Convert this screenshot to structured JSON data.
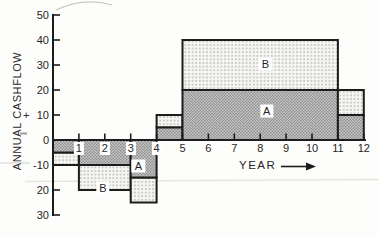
{
  "y_axis": {
    "title": "ANNUAL CASHFLOW",
    "plus": "+"
  },
  "x_axis": {
    "title": "YEAR"
  },
  "chart_data": {
    "type": "area",
    "xlabel": "YEAR",
    "ylabel": "ANNUAL CASHFLOW",
    "x_range": [
      0,
      12
    ],
    "y_range": [
      -30,
      50
    ],
    "grid": false,
    "y_ticks": [
      {
        "value": 50,
        "label": "50"
      },
      {
        "value": 40,
        "label": "40"
      },
      {
        "value": 30,
        "label": "30"
      },
      {
        "value": 20,
        "label": "20"
      },
      {
        "value": 10,
        "label": "10"
      },
      {
        "value": 0,
        "label": "0"
      },
      {
        "value": -10,
        "label": "-10"
      },
      {
        "value": -20,
        "label": "20"
      },
      {
        "value": -30,
        "label": "30"
      }
    ],
    "x_ticks": [
      {
        "value": 1,
        "label": "1",
        "boxed": true
      },
      {
        "value": 2,
        "label": "2",
        "boxed": true
      },
      {
        "value": 3,
        "label": "3",
        "boxed": true
      },
      {
        "value": 4,
        "label": "4",
        "boxed": true
      },
      {
        "value": 5,
        "label": "5",
        "boxed": false
      },
      {
        "value": 6,
        "label": "6",
        "boxed": false
      },
      {
        "value": 7,
        "label": "7",
        "boxed": false
      },
      {
        "value": 8,
        "label": "8",
        "boxed": false
      },
      {
        "value": 9,
        "label": "9",
        "boxed": false
      },
      {
        "value": 10,
        "label": "10",
        "boxed": false
      },
      {
        "value": 11,
        "label": "11",
        "boxed": false
      },
      {
        "value": 12,
        "label": "12",
        "boxed": false
      }
    ],
    "series": [
      {
        "name": "A",
        "steps": [
          {
            "from_year": 0,
            "to_year": 1,
            "value": -5
          },
          {
            "from_year": 1,
            "to_year": 3,
            "value": -10
          },
          {
            "from_year": 3,
            "to_year": 4,
            "value": -15
          },
          {
            "from_year": 4,
            "to_year": 5,
            "value": 5
          },
          {
            "from_year": 5,
            "to_year": 11,
            "value": 20
          },
          {
            "from_year": 11,
            "to_year": 12,
            "value": 10
          }
        ]
      },
      {
        "name": "B",
        "steps": [
          {
            "from_year": 0,
            "to_year": 1,
            "value": -5
          },
          {
            "from_year": 1,
            "to_year": 3,
            "value": -10
          },
          {
            "from_year": 3,
            "to_year": 4,
            "value": -10
          },
          {
            "from_year": 4,
            "to_year": 5,
            "value": 5
          },
          {
            "from_year": 5,
            "to_year": 11,
            "value": 20
          },
          {
            "from_year": 11,
            "to_year": 12,
            "value": 10
          }
        ]
      }
    ],
    "region_labels": [
      {
        "text": "B",
        "year": 8.2,
        "value": 30.5
      },
      {
        "text": "A",
        "year": 8.25,
        "value": 11.5
      },
      {
        "text": "A",
        "year": 3.3,
        "value": -10.5
      },
      {
        "text": "B",
        "year": 1.93,
        "value": -19
      }
    ]
  },
  "colors": {
    "ink": "#1c1c1c",
    "series_A_fill": "#c6c6c6",
    "series_A_dot": "#8e8e8e",
    "series_B_fill": "#f6f5f2",
    "series_B_dot": "#8f8f8f",
    "background": "#fdfdfb",
    "artifact": "#d9d9d4"
  }
}
